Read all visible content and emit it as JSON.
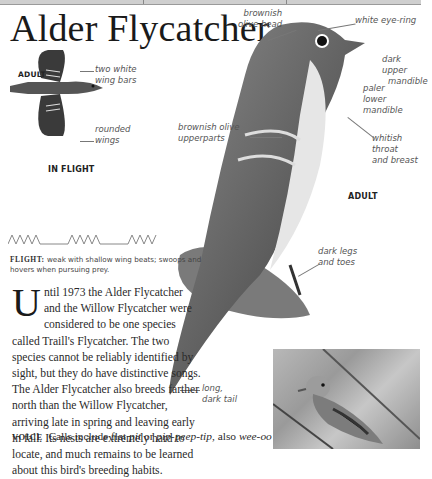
{
  "page": {
    "title": "Alder Flycatcher"
  },
  "flight_illustration": {
    "age_label": "ADULT",
    "caption": "IN FLIGHT",
    "annotations": [
      {
        "line1": "two white",
        "line2": "wing bars"
      },
      {
        "line1": "rounded",
        "line2": "wings"
      }
    ]
  },
  "main_illustration": {
    "age_label": "ADULT",
    "annotations": [
      {
        "id": "head",
        "line1": "brownish",
        "line2": "olive head"
      },
      {
        "id": "eye",
        "line1": "white eye-ring",
        "line2": ""
      },
      {
        "id": "upper_mandible",
        "line1": "dark upper",
        "line2": "mandible"
      },
      {
        "id": "lower_mandible",
        "line1": "paler",
        "line2": "lower mandible"
      },
      {
        "id": "upperparts",
        "line1": "brownish olive",
        "line2": "upperparts"
      },
      {
        "id": "throat",
        "line1": "whitish throat",
        "line2": "and breast"
      },
      {
        "id": "legs",
        "line1": "dark legs",
        "line2": "and toes"
      },
      {
        "id": "tail",
        "line1": "long,",
        "line2": "dark tail"
      }
    ]
  },
  "flight": {
    "label": "FLIGHT:",
    "text": "weak with shallow wing beats; swoops and hovers when pursuing prey."
  },
  "description": {
    "dropcap": "U",
    "text": "ntil 1973 the Alder Flycatcher and the Willow Flycatcher were considered to be one species called Traill's Flycatcher. The two species cannot be reliably identified by sight, but they do have distinctive songs. The Alder Flycatcher also breeds farther north than the Willow Flycatcher, arriving late in spring and leaving early in fall. Its nests are extremely hard to locate, and much remains to be learned about this bird's breeding habits."
  },
  "voice": {
    "label": "VOICE",
    "text_1": "Calls include flat ",
    "em_1": "pit",
    "text_2": " or ",
    "em_2": "pip-peep-tip",
    "text_3": ", also ",
    "em_3": "wee-oo",
    "text_4": " and ",
    "em_4": "churr",
    "text_5": "; male"
  }
}
